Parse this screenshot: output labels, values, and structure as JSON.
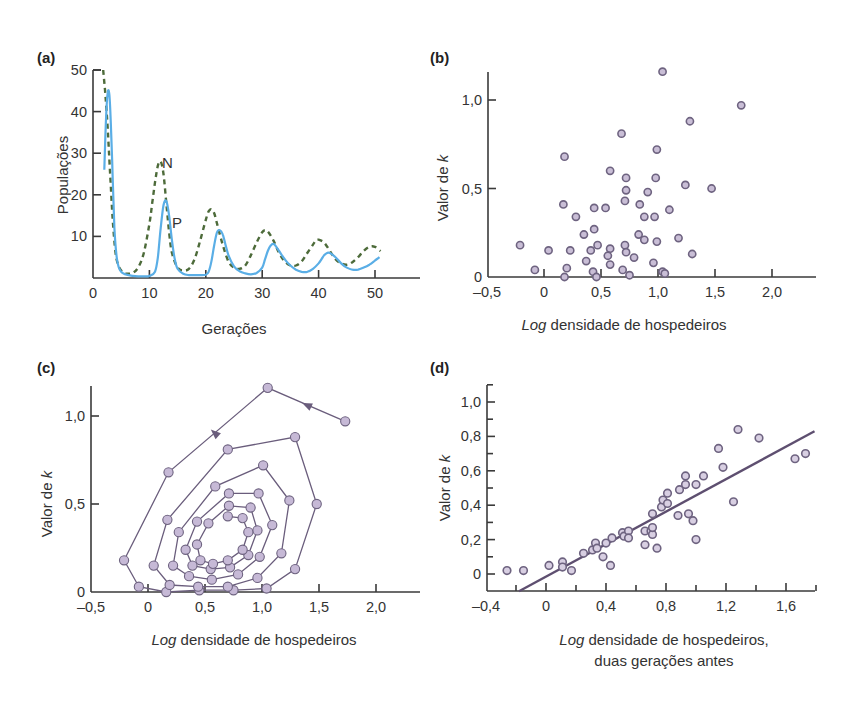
{
  "colors": {
    "axis": "#3a3a3a",
    "text": "#333333",
    "curve_N": "#4d6b3a",
    "curve_P": "#5aaee6",
    "dot_fill_b": "#c9bed6",
    "dot_fill": "#c6b9d6",
    "dot_stroke": "#6e6380",
    "path_line": "#6a5d7c",
    "regression_line": "#5e4f70"
  },
  "chart_data": [
    {
      "id": "a",
      "panel_label": "(a)",
      "type": "line",
      "title": "",
      "xlabel": "Gerações",
      "ylabel": "Populações",
      "xlim": [
        0,
        50
      ],
      "ylim": [
        0,
        50
      ],
      "xticks": [
        0,
        10,
        20,
        30,
        40,
        50
      ],
      "xtick_labels": [
        "0",
        "10",
        "20",
        "30",
        "40",
        "50"
      ],
      "yticks": [
        10,
        20,
        30,
        40,
        50
      ],
      "ytick_labels": [
        "10",
        "20",
        "30",
        "40",
        "50"
      ],
      "grid": false,
      "annotations": [
        {
          "text": "N",
          "x": 12.3,
          "y": 28
        },
        {
          "text": "P",
          "x": 13.8,
          "y": 13.5
        }
      ],
      "series": [
        {
          "name": "N",
          "style": "dashed",
          "x": [
            1.8,
            2.2,
            2.6,
            3.0,
            3.5,
            4.0,
            4.5,
            5.0,
            5.5,
            6.0,
            7.0,
            8.0,
            9.0,
            10.0,
            10.5,
            11.0,
            11.5,
            12.0,
            12.5,
            13.0,
            13.5,
            14.0,
            15.0,
            16.0,
            17.0,
            18.0,
            19.0,
            20.0,
            20.5,
            21.0,
            21.5,
            22.0,
            23.0,
            24.0,
            25.0,
            26.0,
            27.0,
            28.0,
            29.0,
            30.0,
            30.5,
            31.0,
            32.0,
            33.0,
            34.0,
            35.0,
            36.0,
            37.0,
            38.0,
            39.0,
            39.5,
            40.0,
            41.0,
            42.0,
            43.0,
            44.0,
            45.0,
            46.0,
            47.0,
            48.0,
            49.0,
            50.0,
            51.0
          ],
          "y": [
            50,
            44,
            36,
            26,
            14,
            6,
            3,
            1.8,
            1.2,
            1.0,
            1.2,
            2.5,
            6,
            13,
            18,
            23,
            27,
            28,
            25,
            18,
            11,
            6,
            2.5,
            1.8,
            2.2,
            4.5,
            9,
            14,
            16,
            16.5,
            15.5,
            13,
            8,
            4,
            2.5,
            2.2,
            3,
            5.5,
            8.5,
            11,
            11.5,
            11.2,
            9,
            6,
            4,
            3,
            3,
            4,
            6,
            8,
            9,
            9.2,
            8.5,
            6.5,
            4.5,
            3.5,
            3.2,
            3.8,
            5,
            6.5,
            7.5,
            7.5,
            6.5
          ]
        },
        {
          "name": "P",
          "style": "solid",
          "x": [
            2.0,
            2.3,
            2.6,
            2.9,
            3.2,
            3.5,
            3.8,
            4.2,
            4.6,
            5.0,
            5.5,
            6.0,
            7.0,
            8.0,
            9.0,
            10.0,
            11.0,
            11.5,
            12.0,
            12.5,
            13.0,
            13.5,
            14.0,
            14.5,
            15.0,
            16.0,
            17.0,
            18.0,
            19.0,
            20.0,
            20.5,
            21.0,
            21.5,
            22.0,
            22.5,
            23.0,
            23.5,
            24.0,
            25.0,
            26.0,
            27.0,
            28.0,
            29.0,
            30.0,
            30.5,
            31.0,
            31.5,
            32.0,
            32.5,
            33.0,
            34.0,
            35.0,
            36.0,
            37.0,
            38.0,
            39.0,
            40.0,
            40.5,
            41.0,
            41.5,
            42.0,
            43.0,
            44.0,
            45.0,
            46.0,
            47.0,
            48.0,
            49.0,
            50.0,
            50.8
          ],
          "y": [
            26,
            38,
            44.5,
            44,
            36,
            24,
            12,
            5,
            2.5,
            1.5,
            1.0,
            0.8,
            0.5,
            0.4,
            0.4,
            0.5,
            1.5,
            5,
            12,
            17.5,
            18.5,
            15,
            9,
            4.5,
            2.2,
            1.0,
            0.7,
            0.7,
            0.7,
            0.8,
            1.5,
            4,
            8,
            11,
            11.5,
            10.5,
            8,
            5.5,
            2.8,
            1.6,
            1.1,
            0.9,
            1.2,
            2.5,
            4.5,
            6.5,
            7.8,
            8.2,
            7.5,
            6.5,
            4.5,
            3.0,
            2.0,
            1.5,
            1.5,
            2.2,
            3.5,
            4.5,
            5.5,
            6.0,
            6.0,
            5.0,
            3.5,
            2.5,
            2.0,
            2.0,
            2.5,
            3.2,
            4.2,
            5.0
          ]
        }
      ]
    },
    {
      "id": "b",
      "panel_label": "(b)",
      "type": "scatter",
      "title": "",
      "xlabel_italic": "Log",
      "xlabel_rest": " densidade de hospedeiros",
      "xlabel": "Log densidade de hospedeiros",
      "ylabel_text": "Valor de ",
      "ylabel_italic": "k",
      "ylabel": "Valor de k",
      "xlim": [
        -0.5,
        2.4
      ],
      "ylim": [
        0,
        1.2
      ],
      "xticks": [
        -0.5,
        0,
        0.5,
        1.0,
        1.5,
        2.0
      ],
      "xtick_labels": [
        "–0,5",
        "0",
        "0,5",
        "1,0",
        "1,5",
        "2,0"
      ],
      "yticks": [
        0,
        0.5,
        1.0
      ],
      "ytick_labels": [
        "0",
        "0,5",
        "1,0"
      ],
      "grid": false,
      "points": [
        [
          1.04,
          1.16
        ],
        [
          1.73,
          0.97
        ],
        [
          1.28,
          0.88
        ],
        [
          0.68,
          0.81
        ],
        [
          0.99,
          0.72
        ],
        [
          0.18,
          0.68
        ],
        [
          0.58,
          0.6
        ],
        [
          0.72,
          0.56
        ],
        [
          0.98,
          0.56
        ],
        [
          1.24,
          0.52
        ],
        [
          1.47,
          0.5
        ],
        [
          0.72,
          0.49
        ],
        [
          0.91,
          0.48
        ],
        [
          0.71,
          0.43
        ],
        [
          0.84,
          0.41
        ],
        [
          0.17,
          0.41
        ],
        [
          0.44,
          0.39
        ],
        [
          0.54,
          0.39
        ],
        [
          1.1,
          0.38
        ],
        [
          0.28,
          0.34
        ],
        [
          0.88,
          0.34
        ],
        [
          0.97,
          0.34
        ],
        [
          0.44,
          0.27
        ],
        [
          0.35,
          0.24
        ],
        [
          0.83,
          0.24
        ],
        [
          0.88,
          0.21
        ],
        [
          1.18,
          0.22
        ],
        [
          0.99,
          0.2
        ],
        [
          0.47,
          0.18
        ],
        [
          0.71,
          0.18
        ],
        [
          -0.21,
          0.18
        ],
        [
          0.04,
          0.15
        ],
        [
          0.23,
          0.15
        ],
        [
          0.41,
          0.15
        ],
        [
          0.58,
          0.16
        ],
        [
          0.72,
          0.14
        ],
        [
          0.56,
          0.12
        ],
        [
          1.3,
          0.13
        ],
        [
          0.79,
          0.11
        ],
        [
          0.37,
          0.09
        ],
        [
          0.96,
          0.08
        ],
        [
          0.58,
          0.07
        ],
        [
          -0.08,
          0.04
        ],
        [
          0.2,
          0.05
        ],
        [
          0.43,
          0.03
        ],
        [
          0.69,
          0.04
        ],
        [
          1.04,
          0.03
        ],
        [
          0.18,
          0.0
        ],
        [
          0.46,
          0.0
        ],
        [
          0.75,
          0.01
        ],
        [
          1.06,
          0.02
        ]
      ]
    },
    {
      "id": "c",
      "panel_label": "(c)",
      "type": "line",
      "subtype": "connected-scatter (spiral trajectory)",
      "title": "",
      "xlabel_italic": "Log",
      "xlabel_rest": " densidade de hospedeiros",
      "xlabel": "Log densidade de hospedeiros",
      "ylabel_text": "Valor de ",
      "ylabel_italic": "k",
      "ylabel": "Valor de k",
      "xlim": [
        -0.5,
        2.4
      ],
      "ylim": [
        0,
        1.2
      ],
      "xticks": [
        -0.5,
        0,
        0.5,
        1.0,
        1.5,
        2.0
      ],
      "xtick_labels": [
        "–0,5",
        "0",
        "0,5",
        "1,0",
        "1,5",
        "2,0"
      ],
      "yticks": [
        0,
        0.5,
        1.0
      ],
      "ytick_labels": [
        "0",
        "0,5",
        "1,0"
      ],
      "grid": false,
      "arrows": [
        {
          "x": 1.4,
          "y": 1.06,
          "direction": "left"
        },
        {
          "x": 0.59,
          "y": 0.9,
          "direction": "down-left"
        }
      ],
      "trajectory": [
        [
          1.73,
          0.97
        ],
        [
          1.05,
          1.16
        ],
        [
          0.18,
          0.68
        ],
        [
          -0.21,
          0.18
        ],
        [
          -0.08,
          0.03
        ],
        [
          0.16,
          0.0
        ],
        [
          0.45,
          0.01
        ],
        [
          0.75,
          0.01
        ],
        [
          1.04,
          0.02
        ],
        [
          1.29,
          0.13
        ],
        [
          1.48,
          0.5
        ],
        [
          1.29,
          0.88
        ],
        [
          0.7,
          0.81
        ],
        [
          0.17,
          0.41
        ],
        [
          0.05,
          0.15
        ],
        [
          0.19,
          0.04
        ],
        [
          0.44,
          0.03
        ],
        [
          0.7,
          0.03
        ],
        [
          0.96,
          0.08
        ],
        [
          1.17,
          0.22
        ],
        [
          1.24,
          0.52
        ],
        [
          1.01,
          0.72
        ],
        [
          0.59,
          0.6
        ],
        [
          0.27,
          0.34
        ],
        [
          0.22,
          0.15
        ],
        [
          0.36,
          0.09
        ],
        [
          0.56,
          0.07
        ],
        [
          0.79,
          0.1
        ],
        [
          0.98,
          0.2
        ],
        [
          1.09,
          0.38
        ],
        [
          0.97,
          0.56
        ],
        [
          0.71,
          0.56
        ],
        [
          0.43,
          0.4
        ],
        [
          0.33,
          0.24
        ],
        [
          0.39,
          0.15
        ],
        [
          0.55,
          0.13
        ],
        [
          0.72,
          0.14
        ],
        [
          0.88,
          0.21
        ],
        [
          0.96,
          0.35
        ],
        [
          0.9,
          0.48
        ],
        [
          0.71,
          0.49
        ],
        [
          0.53,
          0.39
        ],
        [
          0.43,
          0.27
        ],
        [
          0.46,
          0.18
        ],
        [
          0.57,
          0.16
        ],
        [
          0.7,
          0.18
        ],
        [
          0.83,
          0.24
        ],
        [
          0.88,
          0.34
        ],
        [
          0.83,
          0.42
        ],
        [
          0.7,
          0.43
        ]
      ]
    },
    {
      "id": "d",
      "panel_label": "(d)",
      "type": "scatter",
      "subtype": "scatter with linear regression line",
      "title": "",
      "xlabel_italic": "Log",
      "xlabel_rest": " densidade de hospedeiros,",
      "xlabel_line2": "duas gerações antes",
      "xlabel": "Log densidade de hospedeiros, duas gerações antes",
      "ylabel_text": "Valor de ",
      "ylabel_italic": "k",
      "ylabel": "Valor de k",
      "xlim": [
        -0.4,
        1.8
      ],
      "ylim": [
        -0.1,
        1.1
      ],
      "xticks": [
        -0.4,
        0,
        0.4,
        0.8,
        1.2,
        1.6
      ],
      "xtick_labels": [
        "–0,4",
        "0",
        "0,4",
        "0,8",
        "1,2",
        "1,6"
      ],
      "xminor_ticks": [
        -0.2,
        0.2,
        0.6,
        1.0,
        1.4,
        1.8
      ],
      "yticks": [
        0,
        0.2,
        0.4,
        0.6,
        0.8,
        1.0
      ],
      "ytick_labels": [
        "0",
        "0,2",
        "0,4",
        "0,6",
        "0,8",
        "1,0"
      ],
      "yminor_ticks": [
        0.1,
        0.3,
        0.5,
        0.7,
        0.9,
        1.1
      ],
      "grid": false,
      "regression_line": {
        "x1": -0.18,
        "y1": -0.1,
        "x2": 1.79,
        "y2": 0.83
      },
      "points": [
        [
          -0.26,
          0.02
        ],
        [
          -0.15,
          0.02
        ],
        [
          0.02,
          0.05
        ],
        [
          0.11,
          0.07
        ],
        [
          0.11,
          0.04
        ],
        [
          0.17,
          0.02
        ],
        [
          0.25,
          0.12
        ],
        [
          0.31,
          0.14
        ],
        [
          0.33,
          0.18
        ],
        [
          0.34,
          0.15
        ],
        [
          0.38,
          0.1
        ],
        [
          0.4,
          0.18
        ],
        [
          0.43,
          0.05
        ],
        [
          0.44,
          0.21
        ],
        [
          0.51,
          0.24
        ],
        [
          0.52,
          0.22
        ],
        [
          0.55,
          0.25
        ],
        [
          0.55,
          0.21
        ],
        [
          0.66,
          0.25
        ],
        [
          0.66,
          0.17
        ],
        [
          0.7,
          0.25
        ],
        [
          0.71,
          0.23
        ],
        [
          0.71,
          0.27
        ],
        [
          0.71,
          0.35
        ],
        [
          0.74,
          0.15
        ],
        [
          0.77,
          0.39
        ],
        [
          0.78,
          0.43
        ],
        [
          0.81,
          0.47
        ],
        [
          0.81,
          0.41
        ],
        [
          0.88,
          0.34
        ],
        [
          0.89,
          0.49
        ],
        [
          0.93,
          0.52
        ],
        [
          0.93,
          0.57
        ],
        [
          0.95,
          0.35
        ],
        [
          0.98,
          0.31
        ],
        [
          1.0,
          0.52
        ],
        [
          1.0,
          0.2
        ],
        [
          1.05,
          0.57
        ],
        [
          1.15,
          0.73
        ],
        [
          1.18,
          0.62
        ],
        [
          1.25,
          0.42
        ],
        [
          1.28,
          0.84
        ],
        [
          1.42,
          0.79
        ],
        [
          1.66,
          0.67
        ],
        [
          1.73,
          0.7
        ]
      ]
    }
  ]
}
